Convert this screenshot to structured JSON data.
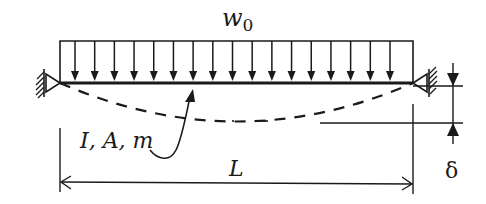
{
  "diagram": {
    "load": {
      "label_main": "w",
      "label_sub": "0",
      "arrow_count": 17
    },
    "beam_properties_label": "I, A, m",
    "span_label": "L",
    "deflection_label": "δ",
    "supports": [
      "left-pin-support",
      "right-pin-support"
    ],
    "colors": {
      "ink": "#1a1a1a",
      "background": "#ffffff"
    }
  }
}
